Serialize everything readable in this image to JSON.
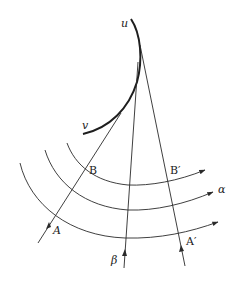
{
  "figure": {
    "colors": {
      "stroke": "#2a2a2a",
      "background": "#ffffff"
    },
    "curve": {
      "name": "caustic-envelope",
      "endpoint_top_label": "u",
      "endpoint_left_label": "v"
    },
    "rays": [
      {
        "id": "ray-A",
        "label_start": "A",
        "label_mid": "B"
      },
      {
        "id": "ray-beta",
        "label_start": "β"
      },
      {
        "id": "ray-A-prime",
        "label_start": "A′",
        "label_mid": "B′"
      }
    ],
    "wavefronts": [
      {
        "id": "wavefront-inner"
      },
      {
        "id": "wavefront-middle",
        "label": "α"
      },
      {
        "id": "wavefront-outer"
      }
    ],
    "labels": {
      "u": "u",
      "v": "v",
      "A": "A",
      "B": "B",
      "A_prime": "A′",
      "B_prime": "B′",
      "alpha": "α",
      "beta": "β"
    }
  }
}
